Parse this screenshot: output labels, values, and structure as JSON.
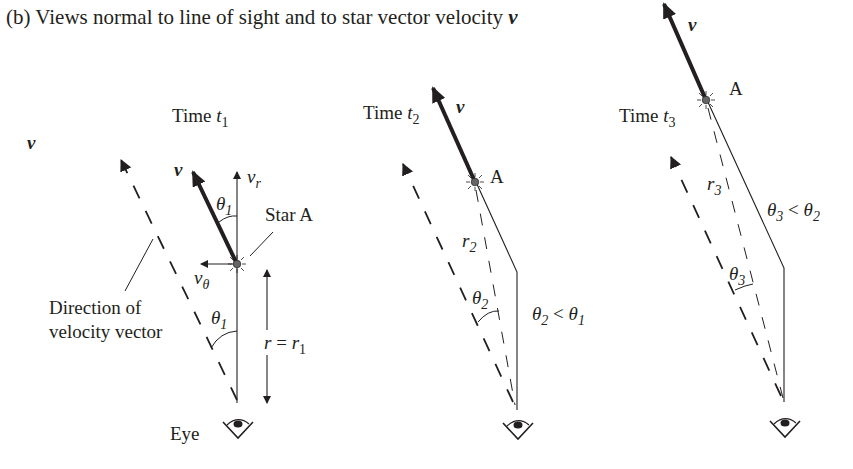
{
  "caption": {
    "prefix": "(b) Views normal to line of sight and to star vector velocity ",
    "symbol": "v"
  },
  "legend": {
    "velocity_symbol": "v"
  },
  "panels": [
    {
      "time_label": "Time ",
      "time_var": "t",
      "time_sub": "1",
      "velocity_label": "v",
      "radial_label": "v",
      "radial_sub": "r",
      "tangential_label": "v",
      "tangential_sub": "θ",
      "angle_label": "θ",
      "angle_sub": "1",
      "angle_label_lower": "θ",
      "angle_sub_lower": "1",
      "star_label": "Star A",
      "distance_label_r": "r",
      "distance_label_eq": " = ",
      "distance_label_r1": "r",
      "distance_sub": "1",
      "direction_label_line1": "Direction of",
      "direction_label_line2": "velocity vector",
      "eye_label": "Eye"
    },
    {
      "time_label": "Time ",
      "time_var": "t",
      "time_sub": "2",
      "velocity_label": "v",
      "star_label": "A",
      "distance_label": "r",
      "distance_sub": "2",
      "angle_label": "θ",
      "angle_sub": "2",
      "relation_a": "θ",
      "relation_a_sub": "2",
      "relation_op": " < ",
      "relation_b": "θ",
      "relation_b_sub": "1"
    },
    {
      "time_label": "Time ",
      "time_var": "t",
      "time_sub": "3",
      "velocity_label": "v",
      "star_label": "A",
      "distance_label": "r",
      "distance_sub": "3",
      "angle_label": "θ",
      "angle_sub": "3",
      "relation_a": "θ",
      "relation_a_sub": "3",
      "relation_op": " < ",
      "relation_b": "θ",
      "relation_b_sub": "2"
    }
  ],
  "colors": {
    "ink": "#231f20",
    "star": "#666666"
  }
}
